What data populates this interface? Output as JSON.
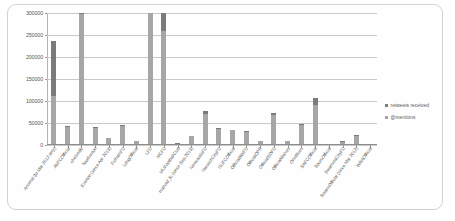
{
  "chart_data": {
    "type": "bar",
    "stacked": true,
    "title": "",
    "xlabel": "",
    "ylabel": "",
    "ylim": [
      0,
      300000
    ],
    "yticks": [
      0,
      50000,
      100000,
      150000,
      200000,
      250000,
      300000
    ],
    "ytick_labels": [
      "0",
      "50000",
      "100000",
      "150000",
      "200000",
      "250000",
      "300000"
    ],
    "grid": true,
    "legend_position": "right",
    "clipped_note": "bars exceeding 300000 are cut off at the plot top",
    "categories": [
      "Arsenal (to Mar 2012 only)",
      "AVFCOfficial",
      "chelseafc",
      "Toorfverton",
      "Everton (since Apr 2013)",
      "FulhamFC",
      "LdsgOfficial",
      "LFC",
      "MCFC",
      "MUFootballClub",
      "manutd_fc (since Sep 2013)",
      "NewcastleFC",
      "NorwichCityFC",
      "NUFCOfficial",
      "OfficialBWFC",
      "OfficialQPR",
      "OfficialSOFC",
      "OfficialWolves",
      "OneBlues",
      "SAFCOfficial",
      "SpursOfficial",
      "SwanseaCityFC",
      "SwansOfficial (since Mar 2012)",
      "WBAOfficial"
    ],
    "series": [
      {
        "name": "@mentions",
        "color": "#a6a6a6",
        "values": [
          111000,
          42000,
          297000,
          39000,
          16000,
          43000,
          9000,
          299000,
          258000,
          3000,
          20000,
          71000,
          36000,
          33000,
          30000,
          8000,
          69000,
          9000,
          45000,
          92000,
          1000,
          7000,
          20000,
          0
        ]
      },
      {
        "name": "retweets received",
        "color": "#7b7b7b",
        "values": [
          126000,
          2000,
          5000,
          2000,
          1000,
          2000,
          1000,
          3000,
          44000,
          500,
          1000,
          7000,
          2000,
          2000,
          2000,
          1000,
          3000,
          1000,
          3000,
          16000,
          200,
          1000,
          2000,
          0
        ]
      }
    ]
  },
  "legend": {
    "entries": [
      {
        "label": "retweets received",
        "swatch": "#7b7b7b"
      },
      {
        "label": "@mentions",
        "swatch": "#a6a6a6"
      }
    ]
  }
}
